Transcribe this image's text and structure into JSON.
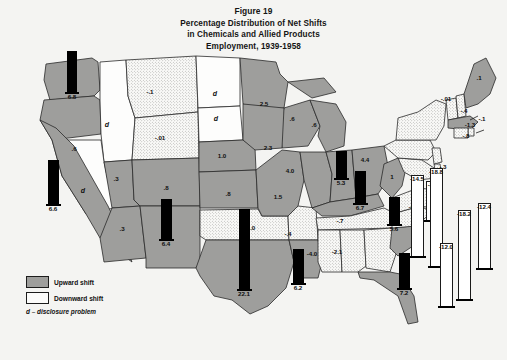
{
  "figure": {
    "title_lines": [
      "Figure 19",
      "Percentage Distribution of Net Shifts",
      "in Chemicals and Allied Products",
      "Employment, 1939-1958"
    ]
  },
  "legend": {
    "upward_label": "Upward shift",
    "downward_label": "Downward shift",
    "disclosure_note": "d – disclosure problem"
  },
  "chart_data": {
    "type": "map",
    "title": "Percentage Distribution of Net Shifts in Chemicals and Allied Products Employment, 1939-1958",
    "units": "percent",
    "legend_entries": [
      "Upward shift",
      "Downward shift",
      "d – disclosure problem"
    ],
    "categories": [
      "Washington",
      "Oregon",
      "Idaho",
      "Nevada",
      "California",
      "Montana",
      "Wyoming",
      "Utah",
      "Arizona",
      "Colorado",
      "New Mexico",
      "North Dakota",
      "South Dakota",
      "Nebraska",
      "Kansas",
      "Oklahoma",
      "Texas",
      "Minnesota",
      "Iowa",
      "Missouri",
      "Arkansas",
      "Louisiana",
      "Wisconsin",
      "Illinois",
      "Michigan",
      "Indiana",
      "Ohio",
      "Kentucky",
      "Tennessee",
      "Mississippi",
      "Alabama",
      "Georgia",
      "Florida",
      "South Carolina",
      "North Carolina",
      "Virginia",
      "West Virginia",
      "Maryland",
      "Delaware",
      "New Jersey",
      "Pennsylvania",
      "New York",
      "Connecticut",
      "Rhode Island",
      "Massachusetts",
      "Vermont",
      "New Hampshire",
      "Maine"
    ],
    "values": [
      6.8,
      0.6,
      null,
      null,
      6.6,
      -0.1,
      -0.01,
      0.3,
      0.3,
      0.8,
      6.4,
      null,
      null,
      1.0,
      0.8,
      -1.0,
      22.1,
      2.5,
      2.3,
      1.5,
      -0.4,
      6.2,
      0.6,
      5.3,
      0.6,
      6.7,
      4.4,
      4.0,
      -0.7,
      -4.0,
      -2.1,
      -3.7,
      7.2,
      5.6,
      -4.3,
      -4.3,
      1.0,
      -18.2,
      -12.0,
      -12.4,
      -14.5,
      -18.8,
      -0.1,
      -0.8,
      -1.3,
      -0.4,
      -0.01,
      0.1
    ]
  },
  "map": {
    "state_labels": [
      {
        "id": "or",
        "text": ".6",
        "x": 74,
        "y": 148
      },
      {
        "id": "id",
        "text": "d",
        "x": 107,
        "y": 124,
        "style": "d"
      },
      {
        "id": "nv",
        "text": "d",
        "x": 83,
        "y": 190,
        "style": "d"
      },
      {
        "id": "mt",
        "text": "-.1",
        "x": 150,
        "y": 91
      },
      {
        "id": "wy",
        "text": "-.01",
        "x": 160,
        "y": 137
      },
      {
        "id": "ut",
        "text": ".3",
        "x": 116,
        "y": 178
      },
      {
        "id": "az",
        "text": ".3",
        "x": 122,
        "y": 228
      },
      {
        "id": "co",
        "text": ".8",
        "x": 166,
        "y": 187
      },
      {
        "id": "nd",
        "text": "d",
        "x": 215,
        "y": 93,
        "style": "d"
      },
      {
        "id": "sd",
        "text": "d",
        "x": 216,
        "y": 118,
        "style": "d"
      },
      {
        "id": "ne",
        "text": "1.0",
        "x": 222,
        "y": 155
      },
      {
        "id": "ks",
        "text": ".8",
        "x": 228,
        "y": 193
      },
      {
        "id": "ok",
        "text": "-1.0",
        "x": 250,
        "y": 227
      },
      {
        "id": "mn",
        "text": "2.5",
        "x": 264,
        "y": 103
      },
      {
        "id": "ia",
        "text": "2.3",
        "x": 268,
        "y": 147
      },
      {
        "id": "mo",
        "text": "1.5",
        "x": 278,
        "y": 196
      },
      {
        "id": "ar",
        "text": "-.4",
        "x": 288,
        "y": 233
      },
      {
        "id": "wi",
        "text": ".6",
        "x": 292,
        "y": 118
      },
      {
        "id": "mi",
        "text": ".6",
        "x": 314,
        "y": 124
      },
      {
        "id": "il-io",
        "text": "4.0",
        "x": 290,
        "y": 170
      },
      {
        "id": "oh",
        "text": "4.4",
        "x": 365,
        "y": 159
      },
      {
        "id": "wv",
        "text": "1",
        "x": 392,
        "y": 176
      },
      {
        "id": "tn",
        "text": "-.7",
        "x": 340,
        "y": 220
      },
      {
        "id": "ms",
        "text": "-4.0",
        "x": 312,
        "y": 253
      },
      {
        "id": "al",
        "text": "-2.1",
        "x": 337,
        "y": 251
      },
      {
        "id": "va",
        "text": "-4.3",
        "x": 414,
        "y": 206
      },
      {
        "id": "me",
        "text": ".1",
        "x": 479,
        "y": 77
      },
      {
        "id": "nh",
        "text": "-.01",
        "x": 446,
        "y": 98
      },
      {
        "id": "vt",
        "text": "-.4",
        "x": 464,
        "y": 110
      },
      {
        "id": "ma",
        "text": "-1.3",
        "x": 470,
        "y": 124
      },
      {
        "id": "ri",
        "text": "-.8",
        "x": 466,
        "y": 135
      },
      {
        "id": "ct",
        "text": "-.1",
        "x": 482,
        "y": 118
      },
      {
        "id": "de",
        "text": "-.3",
        "x": 443,
        "y": 166
      }
    ],
    "bars": [
      {
        "id": "wa",
        "label": "6.8",
        "x": 72,
        "y": 100,
        "height": 40,
        "dir": "up",
        "width": 8
      },
      {
        "id": "ca",
        "label": "6.6",
        "x": 53,
        "y": 212,
        "height": 43,
        "dir": "up",
        "width": 9
      },
      {
        "id": "nm",
        "label": "6.4",
        "x": 166,
        "y": 247,
        "height": 39,
        "dir": "up",
        "width": 9
      },
      {
        "id": "tx",
        "label": "22.1",
        "x": 244,
        "y": 297,
        "height": 79,
        "dir": "up",
        "width": 9
      },
      {
        "id": "la",
        "label": "6.2",
        "x": 298,
        "y": 291,
        "height": 33,
        "dir": "up",
        "width": 9
      },
      {
        "id": "il",
        "label": "5.3",
        "x": 341,
        "y": 186,
        "height": 26,
        "dir": "up",
        "width": 9
      },
      {
        "id": "ky",
        "label": "6.7",
        "x": 360,
        "y": 211,
        "height": 31,
        "dir": "up",
        "width": 9
      },
      {
        "id": "sc",
        "label": "5.6",
        "x": 394,
        "y": 232,
        "height": 26,
        "dir": "up",
        "width": 9
      },
      {
        "id": "fl",
        "label": "7.2",
        "x": 404,
        "y": 296,
        "height": 34,
        "dir": "up",
        "width": 9
      },
      {
        "id": "ga",
        "label": "-3.7",
        "x": 433,
        "y": 228,
        "height": 38,
        "dir": "down",
        "width": 12
      },
      {
        "id": "pa",
        "label": "-14.5",
        "x": 417,
        "y": 264,
        "height": 80,
        "dir": "down",
        "width": 11
      },
      {
        "id": "ny",
        "label": "-18.8",
        "x": 436,
        "y": 274,
        "height": 97,
        "dir": "down",
        "width": 11
      },
      {
        "id": "nj",
        "label": "-12.0",
        "x": 446,
        "y": 314,
        "height": 62,
        "dir": "down",
        "width": 11
      },
      {
        "id": "md",
        "label": "-18.2",
        "x": 464,
        "y": 307,
        "height": 88,
        "dir": "down",
        "width": 11
      },
      {
        "id": "ne2",
        "label": "-12.4",
        "x": 484,
        "y": 276,
        "height": 64,
        "dir": "down",
        "width": 11
      }
    ]
  }
}
